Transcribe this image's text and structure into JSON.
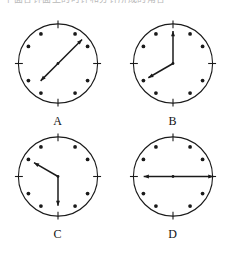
{
  "page": {
    "background_color": "#ffffff",
    "ink_color": "#1a1a1a",
    "top_text_fragment": "下面各钟面上的时针和分针所成的角各是多少度"
  },
  "figure": {
    "type": "clock-faces-worksheet",
    "rows": 2,
    "columns": 2,
    "tick_style": {
      "major_positions": [
        12,
        3,
        6,
        9
      ],
      "major_shape": "line-tick",
      "minor_shape": "dot",
      "total_hour_marks": 12
    },
    "clocks": [
      {
        "id": "clock-a",
        "label": "A",
        "hands": [
          {
            "name": "minute-hand",
            "angle_deg": 45,
            "clock_position": "1:30",
            "length_ratio": 0.86,
            "arrow": true
          },
          {
            "name": "hour-hand",
            "angle_deg": 225,
            "clock_position": "7:30",
            "length_ratio": 0.62,
            "arrow": true
          }
        ]
      },
      {
        "id": "clock-b",
        "label": "B",
        "hands": [
          {
            "name": "minute-hand",
            "angle_deg": 0,
            "clock_position": "12:00",
            "length_ratio": 0.82,
            "arrow": true
          },
          {
            "name": "hour-hand",
            "angle_deg": 240,
            "clock_position": "8:00",
            "length_ratio": 0.72,
            "arrow": true
          }
        ]
      },
      {
        "id": "clock-c",
        "label": "C",
        "hands": [
          {
            "name": "minute-hand",
            "angle_deg": 300,
            "clock_position": "10:00",
            "length_ratio": 0.7,
            "arrow": true
          },
          {
            "name": "hour-hand",
            "angle_deg": 180,
            "clock_position": "6:00",
            "length_ratio": 0.74,
            "arrow": true
          }
        ]
      },
      {
        "id": "clock-d",
        "label": "D",
        "hands": [
          {
            "name": "minute-hand",
            "angle_deg": 90,
            "clock_position": "3:00",
            "length_ratio": 1.02,
            "arrow": true
          },
          {
            "name": "hour-hand",
            "angle_deg": 270,
            "clock_position": "9:00",
            "length_ratio": 0.74,
            "arrow": true
          }
        ]
      }
    ]
  }
}
